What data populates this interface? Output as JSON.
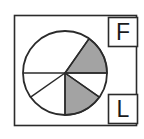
{
  "figure": {
    "name": "pie-diagram-with-labels",
    "background_color": "#ffffff",
    "stroke_color": "#2b2b2b",
    "shaded_color": "#a3a3a3",
    "unshaded_color": "#ffffff",
    "outer_frame": {
      "name": "outer-rectangle",
      "x": 14,
      "y": 15,
      "width": 123,
      "height": 111
    },
    "pie": {
      "name": "sector-circle",
      "center_x": 65,
      "center_y": 73,
      "radius": 42,
      "sector_boundary_angles_deg": [
        0,
        55,
        180,
        215,
        270,
        325
      ],
      "sectors": [
        {
          "label": "sector-1",
          "start_deg": 0,
          "end_deg": 55,
          "shaded": true
        },
        {
          "label": "sector-2",
          "start_deg": 55,
          "end_deg": 180,
          "shaded": false
        },
        {
          "label": "sector-3",
          "start_deg": 180,
          "end_deg": 215,
          "shaded": false
        },
        {
          "label": "sector-4",
          "start_deg": 215,
          "end_deg": 270,
          "shaded": false
        },
        {
          "label": "sector-5",
          "start_deg": 270,
          "end_deg": 325,
          "shaded": true
        },
        {
          "label": "sector-6",
          "start_deg": 325,
          "end_deg": 360,
          "shaded": false
        }
      ]
    },
    "callouts": [
      {
        "key": "top",
        "text": "F",
        "box": {
          "x": 108,
          "y": 17,
          "width": 30,
          "height": 30
        }
      },
      {
        "key": "bottom",
        "text": "L",
        "box": {
          "x": 108,
          "y": 94,
          "width": 30,
          "height": 30
        }
      }
    ]
  }
}
